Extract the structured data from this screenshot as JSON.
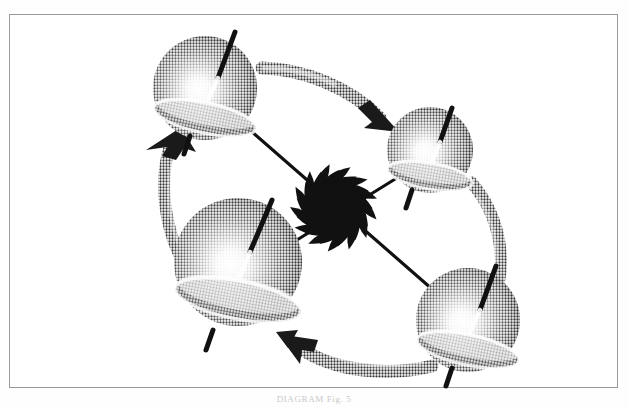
{
  "figure": {
    "caption": "DIAGRAM  Fig. 5",
    "frame": {
      "name": "figure-border",
      "stroke_color": "#9a9a9a",
      "background_color": "#ffffff",
      "x": 9,
      "y": 14,
      "width": 609,
      "height": 374
    },
    "colors": {
      "ink": "#111111",
      "halftone_dark": "#4a4a4a",
      "halftone_mid": "#8d8d8d",
      "halftone_light": "#d6d6d6",
      "paper": "#ffffff",
      "frame": "#9a9a9a",
      "caption": "#c9c9c9"
    },
    "center_burst": {
      "name": "central-starburst",
      "label": "burst",
      "cx": 334,
      "cy": 208,
      "r_outer": 44,
      "r_inner": 26,
      "spikes": 26,
      "color": "#111111"
    },
    "spheres": [
      {
        "id": "top-left",
        "name": "spin-sphere-top-left",
        "label": "A",
        "cx": 205,
        "cy": 88,
        "r": 52,
        "axis_tilt_deg": 18,
        "axis_top_len": 44,
        "axis_bottom_len": 30,
        "band_ry": 15,
        "band_rot_deg": 12,
        "highlight_cx": 198,
        "highlight_cy": 92
      },
      {
        "id": "top-right",
        "name": "spin-sphere-top-right",
        "label": "B",
        "cx": 430,
        "cy": 150,
        "r": 43,
        "axis_tilt_deg": 16,
        "axis_top_len": 40,
        "axis_bottom_len": 28,
        "band_ry": 13,
        "band_rot_deg": 10,
        "highlight_cx": 424,
        "highlight_cy": 155
      },
      {
        "id": "bottom-left",
        "name": "spin-sphere-bottom-left",
        "label": "C",
        "cx": 238,
        "cy": 262,
        "r": 64,
        "axis_tilt_deg": 14,
        "axis_top_len": 52,
        "axis_bottom_len": 36,
        "band_ry": 18,
        "band_rot_deg": 11,
        "highlight_cx": 230,
        "highlight_cy": 268
      },
      {
        "id": "bottom-right",
        "name": "spin-sphere-bottom-right",
        "label": "D",
        "cx": 468,
        "cy": 320,
        "r": 52,
        "axis_tilt_deg": 17,
        "axis_top_len": 44,
        "axis_bottom_len": 32,
        "band_ry": 15,
        "band_rot_deg": 12,
        "highlight_cx": 461,
        "highlight_cy": 326
      }
    ],
    "connector_lines": [
      {
        "name": "connector-line-topleft-to-bottomright",
        "from": "top-left",
        "to": "bottom-right",
        "x1": 243,
        "y1": 124,
        "x2": 440,
        "y2": 296,
        "width": 3
      },
      {
        "name": "connector-line-topright-to-bottomleft",
        "from": "top-right",
        "to": "bottom-left",
        "x1": 398,
        "y1": 176,
        "x2": 286,
        "y2": 246,
        "width": 3
      }
    ],
    "arrows": [
      {
        "name": "arrow-topleft-to-topright",
        "from": "top-left",
        "to": "top-right",
        "direction": "clockwise",
        "path": "M 264 71 C 300 72 345 86 377 116",
        "head_x": 385,
        "head_y": 123,
        "head_rot_deg": 46
      },
      {
        "name": "arrow-topright-to-bottomright",
        "from": "top-right",
        "to": "bottom-right",
        "direction": "clockwise",
        "path": "M 470 183 C 500 220 504 266 490 302",
        "head_x": 487,
        "head_y": 312,
        "head_rot_deg": 110
      },
      {
        "name": "arrow-bottomright-to-bottomleft",
        "from": "bottom-right",
        "to": "bottom-left",
        "direction": "clockwise",
        "path": "M 424 366 C 380 376 330 370 298 348",
        "head_x": 289,
        "head_y": 342,
        "head_rot_deg": 215
      },
      {
        "name": "arrow-bottomleft-to-topleft",
        "from": "bottom-left",
        "to": "top-left",
        "direction": "clockwise",
        "path": "M 182 266 C 164 230 160 180 172 142",
        "head_x": 175,
        "head_y": 133,
        "head_rot_deg": 290
      }
    ]
  }
}
